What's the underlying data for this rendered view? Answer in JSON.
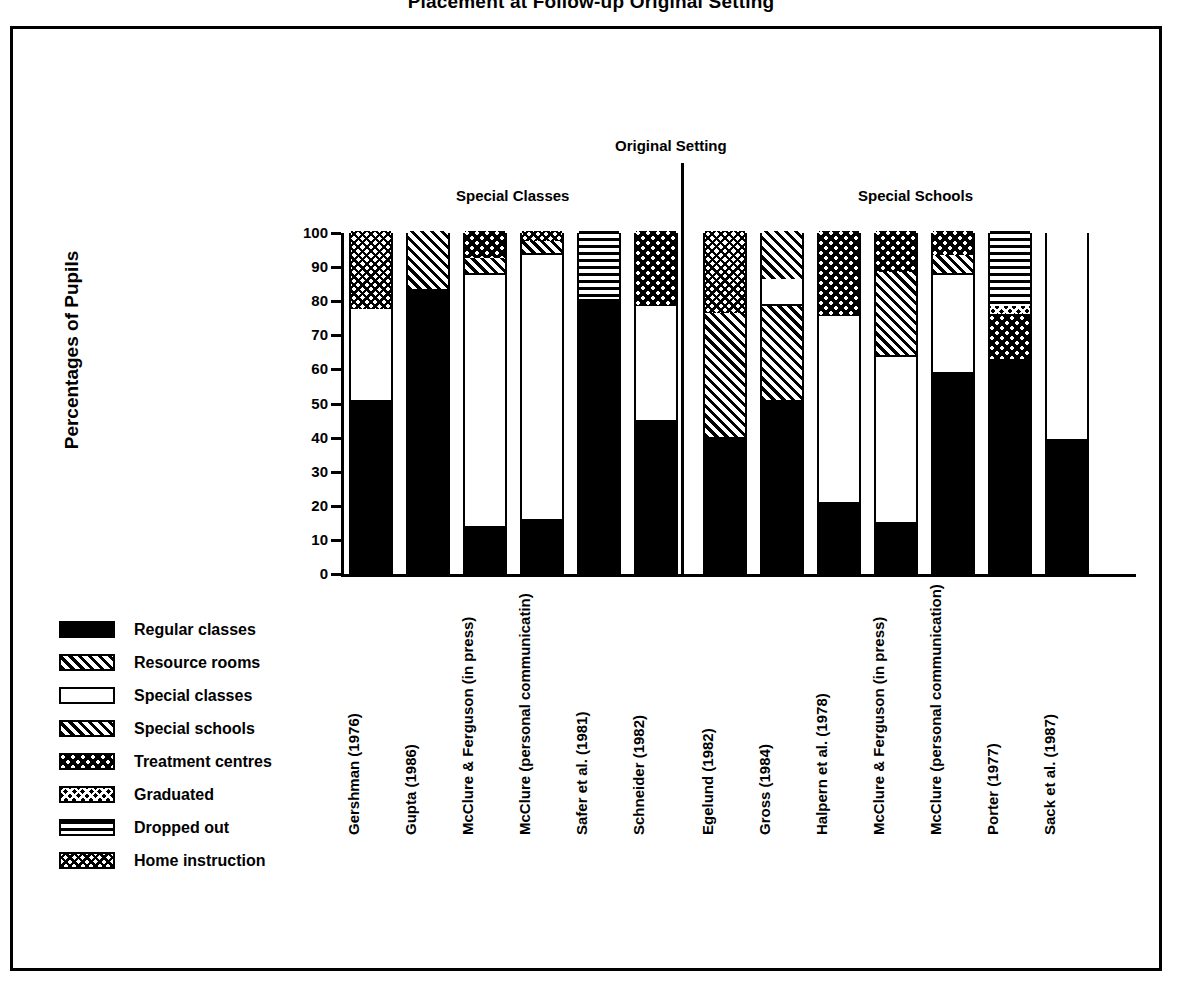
{
  "title": "Placement at Follow-up Original Setting",
  "axis": {
    "ylabel": "Percentages of Pupils",
    "yticks": [
      "100",
      "90",
      "80",
      "70",
      "60",
      "50",
      "40",
      "30",
      "20",
      "10",
      "0"
    ]
  },
  "groups": {
    "divider_label": "Original Setting",
    "left_label": "Special Classes",
    "right_label": "Special Schools"
  },
  "legend": [
    {
      "key": "regular",
      "label": "Regular classes"
    },
    {
      "key": "resource",
      "label": "Resource rooms"
    },
    {
      "key": "specialclasses",
      "label": "Special classes"
    },
    {
      "key": "specialschools",
      "label": "Special schools"
    },
    {
      "key": "treatment",
      "label": "Treatment centres"
    },
    {
      "key": "graduated",
      "label": "Graduated"
    },
    {
      "key": "dropped",
      "label": "Dropped out"
    },
    {
      "key": "home",
      "label": "Home instruction"
    }
  ],
  "chart_data": {
    "type": "bar",
    "subtype": "stacked-bar-100-percent",
    "title": "Placement at Follow-up Original Setting",
    "xlabel": "",
    "ylabel": "Percentages of Pupils",
    "ylim": [
      0,
      100
    ],
    "yticks": [
      0,
      10,
      20,
      30,
      40,
      50,
      60,
      70,
      80,
      90,
      100
    ],
    "grid": false,
    "legend_position": "left-below-axis",
    "series": [
      {
        "name": "Regular classes",
        "key": "regular"
      },
      {
        "name": "Resource rooms",
        "key": "resource"
      },
      {
        "name": "Special classes",
        "key": "specialclasses"
      },
      {
        "name": "Special schools",
        "key": "specialschools"
      },
      {
        "name": "Treatment centres",
        "key": "treatment"
      },
      {
        "name": "Graduated",
        "key": "graduated"
      },
      {
        "name": "Dropped out",
        "key": "dropped"
      },
      {
        "name": "Home instruction",
        "key": "home"
      }
    ],
    "categories": [
      "Gershman (1976)",
      "Gupta (1986)",
      "McClure & Ferguson (in press)",
      "McClure (personal communicatin)",
      "Safer et al. (1981)",
      "Schneider (1982)",
      "Egelund (1982)",
      "Gross (1984)",
      "Halpern et al. (1978)",
      "McClure & Ferguson (in press)",
      "McClure (personal communication)",
      "Porter (1977)",
      "Sack et al. (1987)"
    ],
    "group_of_category": [
      "Special Classes",
      "Special Classes",
      "Special Classes",
      "Special Classes",
      "Special Classes",
      "Special Classes",
      "Special Schools",
      "Special Schools",
      "Special Schools",
      "Special Schools",
      "Special Schools",
      "Special Schools",
      "Special Schools"
    ],
    "bars": [
      {
        "category": "Gershman (1976)",
        "segments": [
          {
            "key": "regular",
            "value": 50
          },
          {
            "key": "specialclasses",
            "value": 27
          },
          {
            "key": "home",
            "value": 23
          }
        ]
      },
      {
        "category": "Gupta (1986)",
        "segments": [
          {
            "key": "regular",
            "value": 83
          },
          {
            "key": "resource",
            "value": 17
          }
        ]
      },
      {
        "category": "McClure & Ferguson (in press)",
        "segments": [
          {
            "key": "regular",
            "value": 13
          },
          {
            "key": "specialclasses",
            "value": 74
          },
          {
            "key": "specialschools",
            "value": 5
          },
          {
            "key": "treatment",
            "value": 8
          }
        ]
      },
      {
        "category": "McClure (personal communicatin)",
        "segments": [
          {
            "key": "regular",
            "value": 15
          },
          {
            "key": "specialclasses",
            "value": 78
          },
          {
            "key": "specialschools",
            "value": 4
          },
          {
            "key": "home",
            "value": 3
          }
        ]
      },
      {
        "category": "Safer et al. (1981)",
        "segments": [
          {
            "key": "regular",
            "value": 80
          },
          {
            "key": "dropped",
            "value": 20
          }
        ]
      },
      {
        "category": "Schneider (1982)",
        "segments": [
          {
            "key": "regular",
            "value": 44
          },
          {
            "key": "specialclasses",
            "value": 34
          },
          {
            "key": "treatment",
            "value": 22
          }
        ]
      },
      {
        "category": "Egelund (1982)",
        "segments": [
          {
            "key": "regular",
            "value": 39
          },
          {
            "key": "resource",
            "value": 37
          },
          {
            "key": "home",
            "value": 24
          }
        ]
      },
      {
        "category": "Gross (1984)",
        "segments": [
          {
            "key": "regular",
            "value": 50
          },
          {
            "key": "resource",
            "value": 28
          },
          {
            "key": "specialclasses",
            "value": 8
          },
          {
            "key": "specialschools",
            "value": 14
          }
        ]
      },
      {
        "category": "Halpern et al. (1978)",
        "segments": [
          {
            "key": "regular",
            "value": 20
          },
          {
            "key": "specialclasses",
            "value": 55
          },
          {
            "key": "treatment",
            "value": 25
          }
        ]
      },
      {
        "category": "McClure & Ferguson (in press)",
        "segments": [
          {
            "key": "regular",
            "value": 14
          },
          {
            "key": "specialclasses",
            "value": 49
          },
          {
            "key": "resource",
            "value": 25
          },
          {
            "key": "treatment",
            "value": 12
          }
        ]
      },
      {
        "category": "McClure (personal communication)",
        "segments": [
          {
            "key": "regular",
            "value": 58
          },
          {
            "key": "specialclasses",
            "value": 29
          },
          {
            "key": "specialschools",
            "value": 6
          },
          {
            "key": "treatment",
            "value": 7
          }
        ]
      },
      {
        "category": "Porter (1977)",
        "segments": [
          {
            "key": "regular",
            "value": 62
          },
          {
            "key": "treatment",
            "value": 13
          },
          {
            "key": "graduated",
            "value": 3
          },
          {
            "key": "dropped",
            "value": 22
          }
        ]
      },
      {
        "category": "Sack et al. (1987)",
        "segments": [
          {
            "key": "regular",
            "value": 39
          },
          {
            "key": "specialclasses",
            "value": 61
          }
        ]
      }
    ]
  }
}
